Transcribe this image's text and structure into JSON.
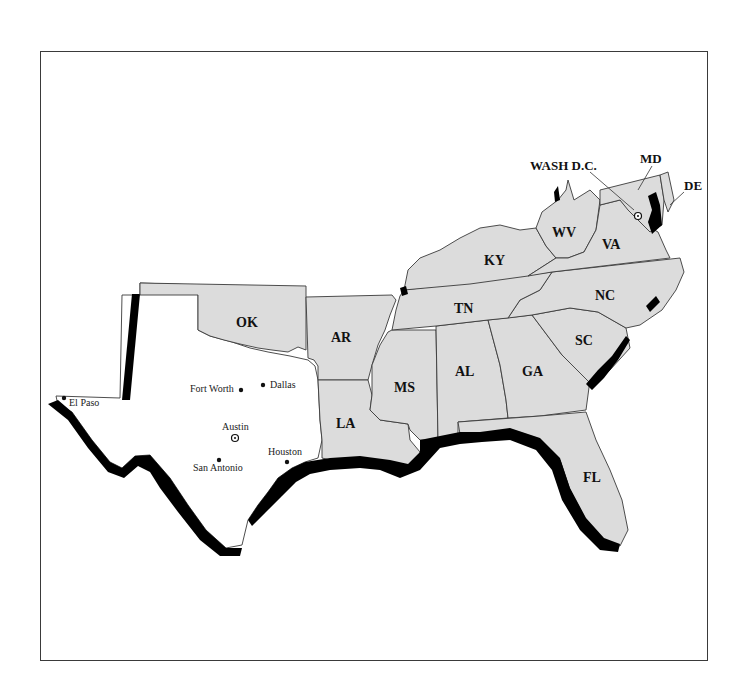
{
  "map": {
    "frame_colors": {
      "border": "#3a3a3a",
      "state_fill": "#dcdcdc",
      "texas_fill": "#ffffff",
      "coastal_band": "#000000"
    },
    "states": [
      {
        "abbr": "OK"
      },
      {
        "abbr": "AR"
      },
      {
        "abbr": "LA"
      },
      {
        "abbr": "MS"
      },
      {
        "abbr": "AL"
      },
      {
        "abbr": "GA"
      },
      {
        "abbr": "FL"
      },
      {
        "abbr": "SC"
      },
      {
        "abbr": "NC"
      },
      {
        "abbr": "TN"
      },
      {
        "abbr": "KY"
      },
      {
        "abbr": "WV"
      },
      {
        "abbr": "VA"
      }
    ],
    "callouts": {
      "wash_dc": "WASH D.C.",
      "md": "MD",
      "de": "DE"
    },
    "cities": [
      {
        "name": "El Paso",
        "symbol": "dot"
      },
      {
        "name": "Fort Worth",
        "symbol": "dot"
      },
      {
        "name": "Dallas",
        "symbol": "dot"
      },
      {
        "name": "Austin",
        "symbol": "star-circle"
      },
      {
        "name": "San Antonio",
        "symbol": "dot"
      },
      {
        "name": "Houston",
        "symbol": "dot"
      }
    ]
  }
}
